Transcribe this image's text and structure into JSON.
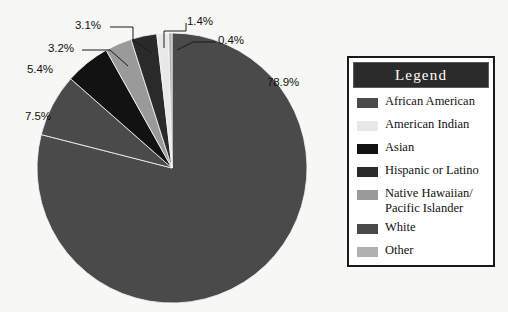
{
  "chart_data": {
    "type": "pie",
    "title": "",
    "legend_title": "Legend",
    "legend_position": "right",
    "grid": false,
    "unit": "%",
    "start_angle_deg": 0,
    "direction": "clockwise",
    "categories": [
      "White",
      "African American",
      "Asian",
      "Native Hawaiian/ Pacific Islander",
      "Hispanic or Latino",
      "American Indian",
      "Other"
    ],
    "values": [
      78.9,
      7.5,
      5.4,
      3.2,
      3.1,
      1.4,
      0.4
    ],
    "slices": [
      {
        "label": "78.9%",
        "value": 78.9,
        "category": "White",
        "color": "#4a4a4a"
      },
      {
        "label": "7.5%",
        "value": 7.5,
        "category": "African American",
        "color": "#4a4a4a"
      },
      {
        "label": "5.4%",
        "value": 5.4,
        "category": "Asian",
        "color": "#121212"
      },
      {
        "label": "3.2%",
        "value": 3.2,
        "category": "Native Hawaiian/ Pacific Islander",
        "color": "#9a9a9a"
      },
      {
        "label": "3.1%",
        "value": 3.1,
        "category": "Hispanic or Latino",
        "color": "#2a2a2a"
      },
      {
        "label": "1.4%",
        "value": 1.4,
        "category": "American Indian",
        "color": "#e8e8e8"
      },
      {
        "label": "0.4%",
        "value": 0.4,
        "category": "Other",
        "color": "#b0b0b0"
      }
    ]
  },
  "labels": {
    "p1": "78.9%",
    "p2": "7.5%",
    "p3": "5.4%",
    "p4": "3.2%",
    "p5": "3.1%",
    "p6": "1.4%",
    "p7": "0.4%"
  },
  "legend": {
    "title": "Legend",
    "items": [
      {
        "label": "African American",
        "color": "#4a4a4a"
      },
      {
        "label": "American Indian",
        "color": "#e8e8e8"
      },
      {
        "label": "Asian",
        "color": "#121212"
      },
      {
        "label": "Hispanic or Latino",
        "color": "#2a2a2a"
      },
      {
        "label": "Native Hawaiian/\nPacific Islander",
        "color": "#9a9a9a"
      },
      {
        "label": "White",
        "color": "#4a4a4a"
      },
      {
        "label": "Other",
        "color": "#b0b0b0"
      }
    ]
  },
  "colors": {
    "background": "#f7f7f5",
    "text": "#111111",
    "legend_border": "#1a1a1a",
    "legend_header_bg": "#2b2b2b",
    "legend_header_text": "#ffffff",
    "leader_line": "#1a1a1a"
  }
}
